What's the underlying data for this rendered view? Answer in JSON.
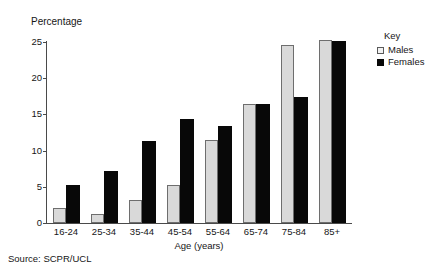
{
  "chart_data": {
    "type": "bar",
    "title": "",
    "subtitle": "",
    "categories": [
      "16-24",
      "25-34",
      "35-44",
      "45-54",
      "55-64",
      "65-74",
      "75-84",
      "85+"
    ],
    "series": [
      {
        "name": "Males",
        "values": [
          2.1,
          1.2,
          3.2,
          5.3,
          11.4,
          16.4,
          24.6,
          25.3
        ],
        "color": "#d9d9d9"
      },
      {
        "name": "Females",
        "values": [
          5.2,
          7.2,
          11.3,
          14.3,
          13.4,
          16.4,
          17.4,
          25.2
        ],
        "color": "#080808"
      }
    ],
    "xlabel": "Age (years)",
    "ylabel": "Percentage",
    "ylim": [
      0,
      25
    ],
    "yticks": [
      0,
      5,
      10,
      15,
      20,
      25
    ],
    "ytick_labels": [
      "0",
      "5",
      "10",
      "15",
      "20",
      "25"
    ],
    "grid": false,
    "legend_position": "top-right",
    "legend_title": "Key",
    "source": "Source: SCPR/UCL"
  },
  "legend": {
    "title": "Key",
    "entries": [
      {
        "label": "Males"
      },
      {
        "label": "Females"
      }
    ]
  },
  "axes": {
    "y_title": "Percentage",
    "x_title": "Age (years)"
  },
  "footnote": {
    "source": "Source: SCPR/UCL"
  }
}
